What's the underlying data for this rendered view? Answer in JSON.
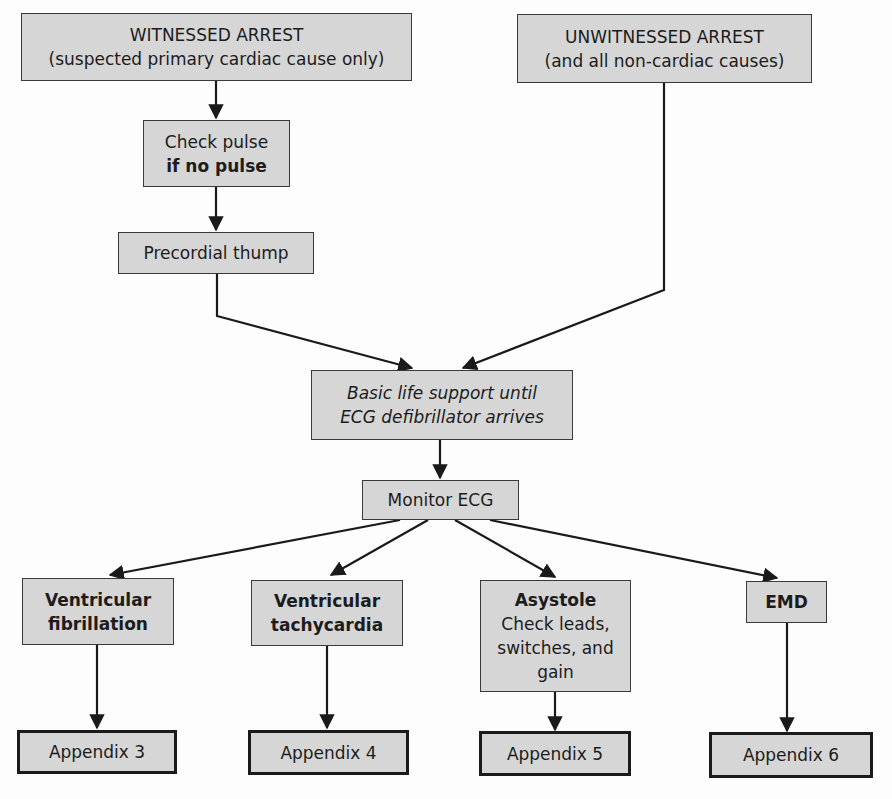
{
  "diagram": {
    "type": "flowchart",
    "nodes": {
      "witnessed": {
        "line1": "WITNESSED ARREST",
        "line2": "(suspected primary cardiac cause only)"
      },
      "unwitnessed": {
        "line1": "UNWITNESSED ARREST",
        "line2": "(and all non-cardiac causes)"
      },
      "check_pulse": {
        "line1": "Check pulse",
        "line2": "if no pulse"
      },
      "thump": {
        "line1": "Precordial thump"
      },
      "bls": {
        "line1": "Basic life support until",
        "line2": "ECG defibrillator arrives"
      },
      "monitor": {
        "line1": "Monitor ECG"
      },
      "vf": {
        "line1": "Ventricular",
        "line2": "fibrillation"
      },
      "vt": {
        "line1": "Ventricular",
        "line2": "tachycardia"
      },
      "asystole": {
        "line1": "Asystole",
        "line2": "Check leads,",
        "line3": "switches, and",
        "line4": "gain"
      },
      "emd": {
        "line1": "EMD"
      },
      "app3": {
        "line1": "Appendix 3"
      },
      "app4": {
        "line1": "Appendix 4"
      },
      "app5": {
        "line1": "Appendix 5"
      },
      "app6": {
        "line1": "Appendix 6"
      }
    },
    "edges": [
      [
        "witnessed",
        "check_pulse"
      ],
      [
        "check_pulse",
        "thump"
      ],
      [
        "thump",
        "bls"
      ],
      [
        "unwitnessed",
        "bls"
      ],
      [
        "bls",
        "monitor"
      ],
      [
        "monitor",
        "vf"
      ],
      [
        "monitor",
        "vt"
      ],
      [
        "monitor",
        "asystole"
      ],
      [
        "monitor",
        "emd"
      ],
      [
        "vf",
        "app3"
      ],
      [
        "vt",
        "app4"
      ],
      [
        "asystole",
        "app5"
      ],
      [
        "emd",
        "app6"
      ]
    ],
    "colors": {
      "box_fill": "#d6d6d6",
      "border": "#3a3a3a",
      "line": "#1a1a1a"
    }
  }
}
